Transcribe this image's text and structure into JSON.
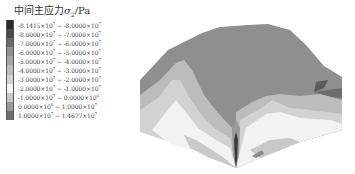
{
  "chart_data": {
    "type": "heatmap",
    "title": "中间主应力σ2/Pa",
    "title_parts": {
      "prefix": "中间主应力",
      "symbol": "σ",
      "subscript": "2",
      "unit": "/Pa"
    },
    "legend": {
      "position": "left",
      "bins": [
        {
          "label": "-8.1415×10⁷ ~ -8.0000×10⁷",
          "min": -81415000,
          "max": -80000000,
          "color": "#2b2b2b"
        },
        {
          "label": "-8.0000×10⁷ ~ -7.0000×10⁷",
          "min": -80000000,
          "max": -70000000,
          "color": "#4a4a4a"
        },
        {
          "label": "-7.0000×10⁷ ~ -6.0000×10⁷",
          "min": -70000000,
          "max": -60000000,
          "color": "#6a6a6a"
        },
        {
          "label": "-6.0000×10⁷ ~ -5.0000×10⁷",
          "min": -60000000,
          "max": -50000000,
          "color": "#8e8e8e"
        },
        {
          "label": "-5.0000×10⁷ ~ -4.0000×10⁷",
          "min": -50000000,
          "max": -40000000,
          "color": "#a5a5a5"
        },
        {
          "label": "-4.0000×10⁷ ~ -3.0000×10⁷",
          "min": -40000000,
          "max": -30000000,
          "color": "#bcbcbc"
        },
        {
          "label": "-3.0000×10⁷ ~ -2.0000×10⁷",
          "min": -30000000,
          "max": -20000000,
          "color": "#d2d2d2"
        },
        {
          "label": "-2.0000×10⁷ ~ -1.0000×10⁷",
          "min": -20000000,
          "max": -10000000,
          "color": "#f5f5f5"
        },
        {
          "label": "-1.0000×10⁷ ~ 0.0000×10⁰",
          "min": -10000000,
          "max": 0,
          "color": "#c8c8c8"
        },
        {
          "label": "0.0000×10⁰ ~ 1.0000×10⁷",
          "min": 0,
          "max": 10000000,
          "color": "#9a9a9a"
        },
        {
          "label": "1.0000×10⁷ ~ 1.4677×10⁷",
          "min": 10000000,
          "max": 14677000,
          "color": "#6e6e6e"
        }
      ]
    },
    "value_range": [
      -81415000,
      14677000
    ],
    "dominant_region_color": "#8f8f8f",
    "xlabel": "",
    "ylabel": ""
  },
  "legend_rows": [
    {
      "a": "-8.1415",
      "e1": "7",
      "b": "-8.0000",
      "e2": "7",
      "color": "#2b2b2b"
    },
    {
      "a": "-8.0000",
      "e1": "7",
      "b": "-7.0000",
      "e2": "7",
      "color": "#4a4a4a"
    },
    {
      "a": "-7.0000",
      "e1": "7",
      "b": "-6.0000",
      "e2": "7",
      "color": "#6a6a6a"
    },
    {
      "a": "-6.0000",
      "e1": "7",
      "b": "-5.0000",
      "e2": "7",
      "color": "#8e8e8e"
    },
    {
      "a": "-5.0000",
      "e1": "7",
      "b": "-4.0000",
      "e2": "7",
      "color": "#a5a5a5"
    },
    {
      "a": "-4.0000",
      "e1": "7",
      "b": "-3.0000",
      "e2": "7",
      "color": "#bcbcbc"
    },
    {
      "a": "-3.0000",
      "e1": "7",
      "b": "-2.0000",
      "e2": "7",
      "color": "#d2d2d2"
    },
    {
      "a": "-2.0000",
      "e1": "7",
      "b": "-1.0000",
      "e2": "7",
      "color": "#f5f5f5"
    },
    {
      "a": "-1.0000",
      "e1": "7",
      "b": "0.0000",
      "e2": "0",
      "color": "#c8c8c8"
    },
    {
      "a": "0.0000",
      "e1": "0",
      "b": "1.0000",
      "e2": "7",
      "color": "#9a9a9a"
    },
    {
      "a": "1.0000",
      "e1": "7",
      "b": "1.4677",
      "e2": "7",
      "color": "#6e6e6e"
    }
  ],
  "legend_title": {
    "prefix": "中间主应力",
    "symbol": "σ",
    "subscript": "2",
    "unit": "/Pa"
  }
}
